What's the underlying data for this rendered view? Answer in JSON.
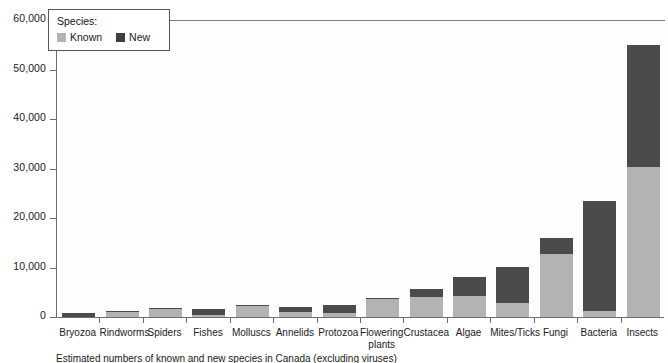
{
  "legend": {
    "title": "Species:",
    "entries": [
      {
        "label": "Known",
        "color": "#b3b3b3",
        "swatch": "known"
      },
      {
        "label": "New",
        "color": "#3f3f3f",
        "swatch": "new"
      }
    ]
  },
  "caption": "Estimated numbers of known and new species in Canada (excluding viruses)",
  "chart_data": {
    "type": "bar",
    "subtype": "stacked-vertical",
    "title": "",
    "subtitle": "",
    "xlabel": "",
    "ylabel": "",
    "ylim": [
      0,
      60000
    ],
    "yticks": [
      0,
      10000,
      20000,
      30000,
      40000,
      50000,
      60000
    ],
    "ytick_labels": [
      "0",
      "10,000",
      "20,000",
      "30,000",
      "40,000",
      "50,000",
      "60,000"
    ],
    "grid": false,
    "legend_position": "top-left-inside",
    "categories": [
      "Bryozoa",
      "Rindworms",
      "Spiders",
      "Fishes",
      "Molluscs",
      "Annelids",
      "Protozoa",
      "Flowering plants",
      "Crustacea",
      "Algae",
      "Mites/Ticks",
      "Fungi",
      "Bacteria",
      "Insects"
    ],
    "series": [
      {
        "name": "Known",
        "color": "#b3b3b3",
        "values": [
          200,
          1300,
          2000,
          600,
          2500,
          1200,
          1000,
          4000,
          4300,
          4400,
          3000,
          13000,
          1400,
          30500
        ]
      },
      {
        "name": "New",
        "color": "#4b4b4b",
        "values": [
          800,
          100,
          100,
          1200,
          100,
          1000,
          1600,
          100,
          1500,
          3900,
          7300,
          3200,
          22300,
          24600
        ]
      }
    ],
    "totals": [
      1000,
      1400,
      2100,
      1800,
      2600,
      2200,
      2600,
      4100,
      5800,
      8300,
      10300,
      16200,
      23700,
      55100
    ]
  }
}
